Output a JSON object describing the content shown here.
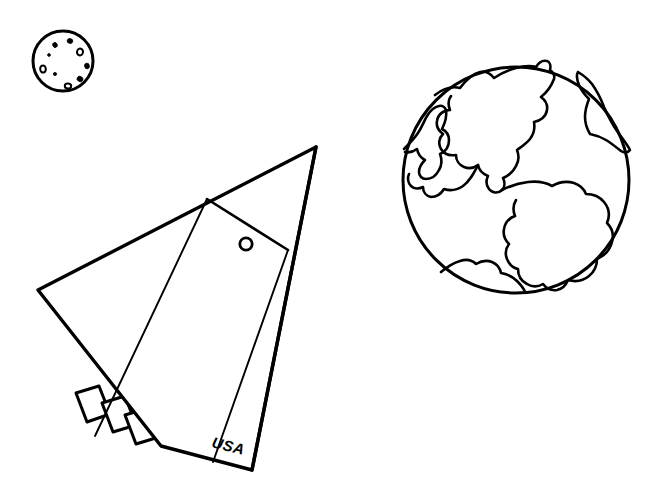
{
  "page": {
    "background_color": "#ffffff",
    "ink_color": "#000000",
    "width": 665,
    "height": 495,
    "style": "black-and-white line art"
  },
  "moon": {
    "label": "Moon",
    "center_x": 63,
    "center_y": 61,
    "radius": 30,
    "stroke_width": 3,
    "crater_count": 9,
    "craters": [
      {
        "cx": 55,
        "cy": 45,
        "rx": 2.2,
        "ry": 2.6,
        "rot": -25
      },
      {
        "cx": 70,
        "cy": 41,
        "rx": 2.8,
        "ry": 2.4,
        "rot": 10
      },
      {
        "cx": 80,
        "cy": 52,
        "rx": 3.0,
        "ry": 3.4,
        "rot": 15
      },
      {
        "cx": 87,
        "cy": 66,
        "rx": 2.4,
        "ry": 2.8,
        "rot": -10
      },
      {
        "cx": 80,
        "cy": 79,
        "rx": 3.0,
        "ry": 2.6,
        "rot": 30
      },
      {
        "cx": 68,
        "cy": 86,
        "rx": 3.2,
        "ry": 2.6,
        "rot": 5
      },
      {
        "cx": 43,
        "cy": 69,
        "rx": 2.8,
        "ry": 3.6,
        "rot": -5
      },
      {
        "cx": 55,
        "cy": 74,
        "rx": 1.6,
        "ry": 1.6,
        "rot": 0
      },
      {
        "cx": 49,
        "cy": 55,
        "rx": 1.4,
        "ry": 1.4,
        "rot": 0
      }
    ]
  },
  "earth": {
    "label": "Earth",
    "center_x": 516,
    "center_y": 180,
    "radius": 113,
    "stroke_width": 3,
    "continent_stroke_width": 2.6,
    "continents": [
      {
        "name": "north-america"
      },
      {
        "name": "south-america"
      },
      {
        "name": "asia-left-edge"
      },
      {
        "name": "europe-africa-right-edge"
      },
      {
        "name": "antarctica-bottom"
      }
    ]
  },
  "rocket": {
    "label": "Rocket Ship",
    "marking_text": "USA",
    "stroke_width": 3,
    "body_stroke_width": 1.8,
    "nose_tip_x": 316,
    "nose_tip_y": 147,
    "left_wing_tip_x": 38,
    "left_wing_tip_y": 290,
    "bottom_tip_x": 252,
    "bottom_tip_y": 470,
    "porthole": {
      "cx": 246,
      "cy": 244,
      "r": 6.2,
      "stroke_width": 2.6
    },
    "engine_count": 3,
    "engines": [
      {
        "name": "engine-nozzle-1"
      },
      {
        "name": "engine-nozzle-2"
      },
      {
        "name": "engine-nozzle-3"
      }
    ]
  }
}
